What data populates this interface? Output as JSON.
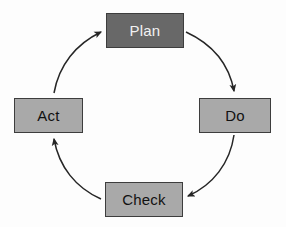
{
  "diagram": {
    "type": "pdca-cycle",
    "background_color": "#fdfdfd",
    "direction": "clockwise",
    "nodes": [
      {
        "id": "plan",
        "label": "Plan",
        "position": "top",
        "fill_color": "#686868",
        "text_color": "#f2f2f2",
        "border_color": "#3d3d3d"
      },
      {
        "id": "do",
        "label": "Do",
        "position": "right",
        "fill_color": "#a9a9a9",
        "text_color": "#111111",
        "border_color": "#3d3d3d"
      },
      {
        "id": "check",
        "label": "Check",
        "position": "bottom",
        "fill_color": "#a9a9a9",
        "text_color": "#111111",
        "border_color": "#3d3d3d"
      },
      {
        "id": "act",
        "label": "Act",
        "position": "left",
        "fill_color": "#a9a9a9",
        "text_color": "#111111",
        "border_color": "#3d3d3d"
      }
    ],
    "edges": [
      {
        "id": "plan-to-do",
        "from": "plan",
        "to": "do",
        "style": "curved-arrow",
        "color": "#262626"
      },
      {
        "id": "do-to-check",
        "from": "do",
        "to": "check",
        "style": "curved-arrow",
        "color": "#262626"
      },
      {
        "id": "check-to-act",
        "from": "check",
        "to": "act",
        "style": "curved-arrow",
        "color": "#262626"
      },
      {
        "id": "act-to-plan",
        "from": "act",
        "to": "plan",
        "style": "curved-arrow",
        "color": "#262626"
      }
    ]
  }
}
